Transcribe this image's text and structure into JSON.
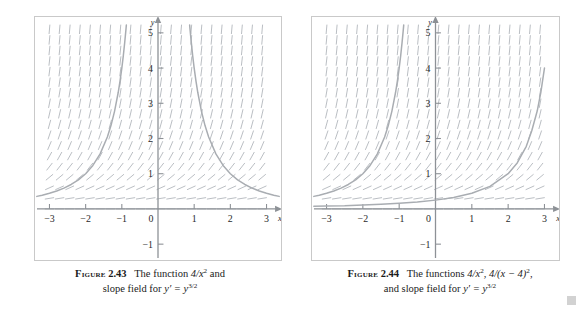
{
  "figures": [
    {
      "id": "figure-2-43",
      "caption": {
        "label": "Figure",
        "number": "2.43",
        "line1_prefix": "The function",
        "line1_math": "4/x",
        "line1_exp": "2",
        "line1_suffix": "and",
        "line2_prefix": "slope field for",
        "line2_math_y": "y′ = y",
        "line2_exp": "3/2"
      },
      "axes": {
        "x_label": "x",
        "y_label": "y",
        "x_ticks": [
          "-3",
          "-2",
          "-1",
          "0",
          "1",
          "2",
          "3"
        ],
        "y_ticks": [
          "5",
          "4",
          "3",
          "2",
          "1",
          "-1"
        ],
        "x_range": [
          -3.4,
          3.4
        ],
        "y_range": [
          -1.45,
          5.45
        ]
      },
      "chart_data": {
        "type": "line",
        "title": "The function 4/x^2 and slope field for y' = y^(3/2)",
        "xlabel": "x",
        "ylabel": "y",
        "xlim": [
          -3.4,
          3.4
        ],
        "ylim": [
          -1.45,
          5.45
        ],
        "xticks": [
          -3,
          -2,
          -1,
          0,
          1,
          2,
          3
        ],
        "yticks": [
          -1,
          1,
          2,
          3,
          4,
          5
        ],
        "grid": false,
        "legend": "none",
        "slope_field": {
          "equation": "y' = y^(3/2)",
          "x_samples": [
            -3.0,
            -2.72,
            -2.44,
            -2.16,
            -1.88,
            -1.6,
            -1.32,
            -1.04,
            -0.76,
            -0.48,
            -0.2,
            0.08,
            0.36,
            0.64,
            0.92,
            1.2,
            1.48,
            1.76,
            2.04,
            2.32,
            2.6,
            2.88
          ],
          "y_samples": [
            0.0,
            0.3,
            0.6,
            0.9,
            1.2,
            1.5,
            1.8,
            2.1,
            2.4,
            2.7,
            3.0,
            3.3,
            3.6,
            3.9,
            4.2,
            4.5,
            4.8,
            5.1
          ],
          "color": "#b9bdc2"
        },
        "series": [
          {
            "name": "4/x^2 (left branch)",
            "expression": "4/x^2",
            "domain": [
              -3.35,
              -0.88
            ],
            "color": "#a9adb2",
            "points": [
              [
                -3.35,
                0.356
              ],
              [
                -3.2,
                0.391
              ],
              [
                -3.0,
                0.444
              ],
              [
                -2.8,
                0.51
              ],
              [
                -2.6,
                0.592
              ],
              [
                -2.4,
                0.694
              ],
              [
                -2.2,
                0.826
              ],
              [
                -2.0,
                1.0
              ],
              [
                -1.8,
                1.235
              ],
              [
                -1.6,
                1.563
              ],
              [
                -1.4,
                2.041
              ],
              [
                -1.3,
                2.367
              ],
              [
                -1.2,
                2.778
              ],
              [
                -1.1,
                3.306
              ],
              [
                -1.05,
                3.628
              ],
              [
                -1.0,
                4.0
              ],
              [
                -0.96,
                4.34
              ],
              [
                -0.92,
                4.73
              ],
              [
                -0.89,
                5.05
              ],
              [
                -0.875,
                5.22
              ]
            ]
          },
          {
            "name": "4/x^2 (right branch)",
            "expression": "4/x^2",
            "domain": [
              0.88,
              3.35
            ],
            "color": "#a9adb2",
            "points": [
              [
                0.875,
                5.22
              ],
              [
                0.89,
                5.05
              ],
              [
                0.92,
                4.73
              ],
              [
                0.96,
                4.34
              ],
              [
                1.0,
                4.0
              ],
              [
                1.05,
                3.628
              ],
              [
                1.1,
                3.306
              ],
              [
                1.2,
                2.778
              ],
              [
                1.3,
                2.367
              ],
              [
                1.4,
                2.041
              ],
              [
                1.6,
                1.563
              ],
              [
                1.8,
                1.235
              ],
              [
                2.0,
                1.0
              ],
              [
                2.2,
                0.826
              ],
              [
                2.4,
                0.694
              ],
              [
                2.6,
                0.592
              ],
              [
                2.8,
                0.51
              ],
              [
                3.0,
                0.444
              ],
              [
                3.2,
                0.391
              ],
              [
                3.35,
                0.356
              ]
            ]
          }
        ]
      }
    },
    {
      "id": "figure-2-44",
      "caption": {
        "label": "Figure",
        "number": "2.44",
        "line1_prefix": "The functions",
        "line1_math_a": "4/x",
        "line1_exp_a": "2",
        "line1_math_b": "4/(x − 4)",
        "line1_exp_b": "2",
        "line2_prefix": "and slope field for",
        "line2_math_y": "y′ = y",
        "line2_exp": "3/2"
      },
      "axes": {
        "x_label": "x",
        "y_label": "y",
        "x_ticks": [
          "-3",
          "-2",
          "-1",
          "0",
          "1",
          "2",
          "3"
        ],
        "y_ticks": [
          "5",
          "4",
          "3",
          "2",
          "1",
          "-1"
        ],
        "x_range": [
          -3.4,
          3.4
        ],
        "y_range": [
          -1.45,
          5.45
        ]
      },
      "chart_data": {
        "type": "line",
        "title": "The functions 4/x^2, 4/(x-4)^2, and slope field for y' = y^(3/2)",
        "xlabel": "x",
        "ylabel": "y",
        "xlim": [
          -3.4,
          3.4
        ],
        "ylim": [
          -1.45,
          5.45
        ],
        "xticks": [
          -3,
          -2,
          -1,
          0,
          1,
          2,
          3
        ],
        "yticks": [
          -1,
          1,
          2,
          3,
          4,
          5
        ],
        "grid": false,
        "legend": "none",
        "slope_field": {
          "equation": "y' = y^(3/2)",
          "x_samples": [
            -3.0,
            -2.72,
            -2.44,
            -2.16,
            -1.88,
            -1.6,
            -1.32,
            -1.04,
            -0.76,
            -0.48,
            -0.2,
            0.08,
            0.36,
            0.64,
            0.92,
            1.2,
            1.48,
            1.76,
            2.04,
            2.32,
            2.6,
            2.88
          ],
          "y_samples": [
            0.0,
            0.3,
            0.6,
            0.9,
            1.2,
            1.5,
            1.8,
            2.1,
            2.4,
            2.7,
            3.0,
            3.3,
            3.6,
            3.9,
            4.2,
            4.5,
            4.8,
            5.1
          ],
          "color": "#b9bdc2"
        },
        "series": [
          {
            "name": "4/x^2 (left branch)",
            "expression": "4/x^2",
            "domain": [
              -3.35,
              -0.88
            ],
            "color": "#a9adb2",
            "points": [
              [
                -3.35,
                0.356
              ],
              [
                -3.2,
                0.391
              ],
              [
                -3.0,
                0.444
              ],
              [
                -2.8,
                0.51
              ],
              [
                -2.6,
                0.592
              ],
              [
                -2.4,
                0.694
              ],
              [
                -2.2,
                0.826
              ],
              [
                -2.0,
                1.0
              ],
              [
                -1.8,
                1.235
              ],
              [
                -1.6,
                1.563
              ],
              [
                -1.4,
                2.041
              ],
              [
                -1.3,
                2.367
              ],
              [
                -1.2,
                2.778
              ],
              [
                -1.1,
                3.306
              ],
              [
                -1.05,
                3.628
              ],
              [
                -1.0,
                4.0
              ],
              [
                -0.96,
                4.34
              ],
              [
                -0.92,
                4.73
              ],
              [
                -0.89,
                5.05
              ],
              [
                -0.875,
                5.22
              ]
            ]
          },
          {
            "name": "4/(x-4)^2",
            "expression": "4/(x-4)^2",
            "domain": [
              -3.35,
              3.0
            ],
            "color": "#a9adb2",
            "points": [
              [
                -3.35,
                0.0778
              ],
              [
                -3.0,
                0.0816
              ],
              [
                -2.5,
                0.0876
              ],
              [
                -2.0,
                0.111
              ],
              [
                -1.5,
                0.131
              ],
              [
                -1.0,
                0.16
              ],
              [
                -0.5,
                0.198
              ],
              [
                0.0,
                0.25
              ],
              [
                0.5,
                0.327
              ],
              [
                1.0,
                0.444
              ],
              [
                1.5,
                0.64
              ],
              [
                2.0,
                1.0
              ],
              [
                2.25,
                1.306
              ],
              [
                2.5,
                1.778
              ],
              [
                2.65,
                2.22
              ],
              [
                2.8,
                2.78
              ],
              [
                2.9,
                3.31
              ],
              [
                3.0,
                4.0
              ]
            ]
          }
        ]
      }
    }
  ],
  "page": {
    "corner_mark_color": "#d2d2d2"
  }
}
